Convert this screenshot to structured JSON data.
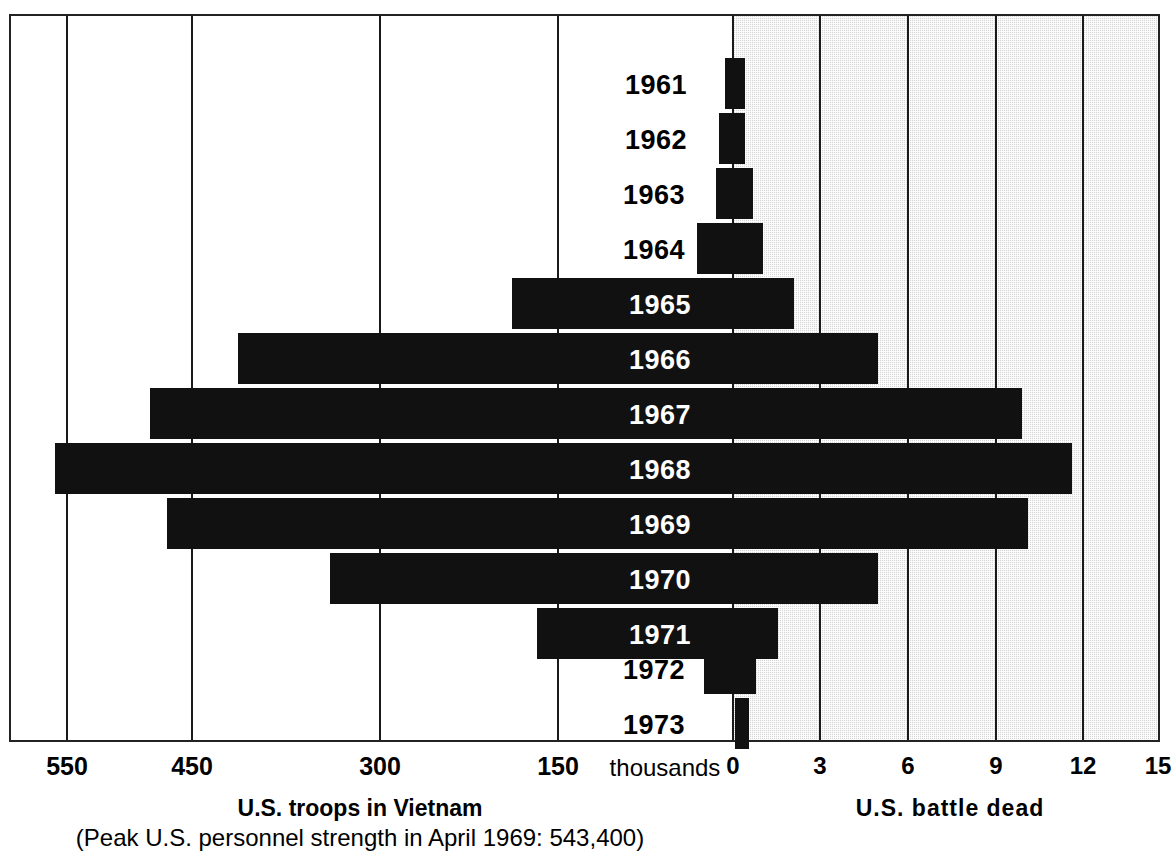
{
  "chart_data": {
    "type": "bar",
    "subtype": "bidirectional-population-pyramid",
    "title": "",
    "categories": [
      "1961",
      "1962",
      "1963",
      "1964",
      "1965",
      "1966",
      "1967",
      "1968",
      "1969",
      "1970",
      "1971",
      "1972",
      "1973"
    ],
    "series": [
      {
        "name": "U.S. troops in Vietnam",
        "side": "left",
        "units": "thousands",
        "axis_label": "U.S. troops in Vietnam",
        "axis_ticks": [
          550,
          450,
          300,
          150,
          0
        ],
        "axis_range": [
          0,
          612
        ],
        "values": [
          3.2,
          11.3,
          16.3,
          23.3,
          184.3,
          385.3,
          485.6,
          536.1,
          475.2,
          334.6,
          156.8,
          24.2,
          0.2
        ]
      },
      {
        "name": "U.S. battle dead",
        "side": "right",
        "units": "thousands",
        "axis_label": "U.S.  battle  dead",
        "axis_ticks": [
          0,
          3,
          6,
          9,
          12,
          15
        ],
        "axis_range": [
          0,
          15
        ],
        "values": [
          0.4,
          0.4,
          0.7,
          1.0,
          2.1,
          5.0,
          9.4,
          11.6,
          9.9,
          5.0,
          1.5,
          0.8,
          0.3
        ]
      }
    ],
    "left_tick_labels": [
      "550",
      "450",
      "300",
      "150"
    ],
    "right_tick_labels": [
      "0",
      "3",
      "6",
      "9",
      "12",
      "15"
    ],
    "center_unit_label": "thousands",
    "annotation": "(Peak U.S. personnel strength in April 1969: 543,400)",
    "grid": true,
    "legend": "none",
    "colors": {
      "bar": "#111111",
      "shaded_panel": "#d6d6d6",
      "background": "#ffffff",
      "gridline": "#1a1a1a"
    }
  },
  "axis": {
    "left_title": "U.S. troops in Vietnam",
    "right_title": "U.S.  battle  dead",
    "center_label": "thousands",
    "note": "(Peak U.S. personnel strength in April 1969: 543,400)"
  },
  "ticks": {
    "left": [
      {
        "label": "550",
        "x": 67
      },
      {
        "label": "450",
        "x": 192
      },
      {
        "label": "300",
        "x": 380
      },
      {
        "label": "150",
        "x": 558
      }
    ],
    "right": [
      {
        "label": "0",
        "x": 733
      },
      {
        "label": "3",
        "x": 820
      },
      {
        "label": "6",
        "x": 908
      },
      {
        "label": "9",
        "x": 996
      },
      {
        "label": "12",
        "x": 1083
      },
      {
        "label": "15",
        "x": 1158
      }
    ]
  },
  "bars": [
    {
      "year": "1961",
      "left_px": 725,
      "right_px": 745,
      "top": 58,
      "label_color": "#000000",
      "label_x": 596
    },
    {
      "year": "1962",
      "left_px": 719,
      "right_px": 745,
      "top": 113,
      "label_color": "#000000",
      "label_x": 596
    },
    {
      "year": "1963",
      "left_px": 716,
      "right_px": 753,
      "top": 168,
      "label_color": "#000000",
      "label_x": 594
    },
    {
      "year": "1964",
      "left_px": 697,
      "right_px": 763,
      "top": 223,
      "label_color": "#000000",
      "label_x": 594
    },
    {
      "year": "1965",
      "left_px": 512,
      "right_px": 794,
      "top": 278,
      "label_color": "#ffffff",
      "label_x": 600
    },
    {
      "year": "1966",
      "left_px": 238,
      "right_px": 878,
      "top": 333,
      "label_color": "#ffffff",
      "label_x": 600
    },
    {
      "year": "1967",
      "left_px": 150,
      "right_px": 1022,
      "top": 388,
      "label_color": "#ffffff",
      "label_x": 600
    },
    {
      "year": "1968",
      "left_px": 55,
      "right_px": 1072,
      "top": 443,
      "label_color": "#ffffff",
      "label_x": 600
    },
    {
      "year": "1969",
      "left_px": 167,
      "right_px": 1028,
      "top": 498,
      "label_color": "#ffffff",
      "label_x": 600
    },
    {
      "year": "1970",
      "left_px": 330,
      "right_px": 878,
      "top": 553,
      "label_color": "#ffffff",
      "label_x": 600
    },
    {
      "year": "1971",
      "left_px": 537,
      "right_px": 778,
      "top": 608,
      "label_color": "#ffffff",
      "label_x": 600
    },
    {
      "year": "1972",
      "left_px": 704,
      "right_px": 756,
      "top": 643,
      "label_color": "#000000",
      "label_x": 594
    },
    {
      "year": "1973",
      "left_px": 735,
      "right_px": 749,
      "top": 698,
      "label_color": "#000000",
      "label_x": 594
    }
  ],
  "layout": {
    "frame": {
      "left": 9,
      "top": 14,
      "width": 1151,
      "height": 728
    },
    "zero_x": 733,
    "bar_height": 51,
    "shade_left": 733,
    "shade_right": 1158
  }
}
